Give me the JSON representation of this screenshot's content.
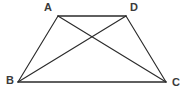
{
  "figure": {
    "kind": "geometry-diagram",
    "background_color": "#ffffff",
    "stroke_color": "#2b2b2b",
    "label_color": "#3a3a3a",
    "canvas": {
      "width": 187,
      "height": 97
    },
    "vertices": [
      {
        "id": "A",
        "label": "A",
        "x": 58,
        "y": 16,
        "label_x": 44,
        "label_y": 2
      },
      {
        "id": "D",
        "label": "D",
        "x": 126,
        "y": 16,
        "label_x": 130,
        "label_y": 2
      },
      {
        "id": "B",
        "label": "B",
        "x": 18,
        "y": 82,
        "label_x": 6,
        "label_y": 75
      },
      {
        "id": "C",
        "label": "C",
        "x": 166,
        "y": 82,
        "label_x": 172,
        "label_y": 77
      }
    ],
    "edges": [
      {
        "id": "AD",
        "from": "A",
        "to": "D",
        "role": "top-side",
        "x1": 58,
        "y1": 16,
        "x2": 126,
        "y2": 16
      },
      {
        "id": "AB",
        "from": "A",
        "to": "B",
        "role": "left-side",
        "x1": 58,
        "y1": 16,
        "x2": 18,
        "y2": 82
      },
      {
        "id": "DC",
        "from": "D",
        "to": "C",
        "role": "right-side",
        "x1": 126,
        "y1": 16,
        "x2": 166,
        "y2": 82
      },
      {
        "id": "BC",
        "from": "B",
        "to": "C",
        "role": "bottom-side",
        "x1": 18,
        "y1": 82,
        "x2": 166,
        "y2": 82
      }
    ],
    "diagonals": [
      {
        "id": "AC",
        "from": "A",
        "to": "C",
        "x1": 58,
        "y1": 16,
        "x2": 166,
        "y2": 82
      },
      {
        "id": "BD",
        "from": "B",
        "to": "D",
        "x1": 18,
        "y1": 82,
        "x2": 126,
        "y2": 16
      }
    ],
    "intersection": {
      "id": "diagonal-crossing",
      "x": 93,
      "y": 41
    }
  }
}
